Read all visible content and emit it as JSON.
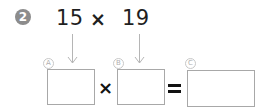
{
  "problem": {
    "number": "2",
    "expression": {
      "left_operand": "15",
      "operator": "×",
      "right_operand": "19"
    }
  },
  "answer_row": {
    "boxes": [
      {
        "label": "A",
        "value": ""
      },
      {
        "label": "B",
        "value": ""
      },
      {
        "label": "C",
        "value": ""
      }
    ],
    "multiply_sign": "×",
    "equals_sign": "="
  }
}
